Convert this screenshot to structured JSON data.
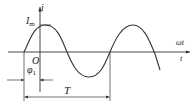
{
  "diagram": {
    "type": "sinusoidal-waveform",
    "labels": {
      "y_axis": "i",
      "amplitude": "I",
      "amplitude_sub": "m",
      "origin": "O",
      "phase": "φ",
      "phase_sub": "1",
      "period": "T",
      "x_axis_top": "ωt",
      "x_axis_bottom": "t"
    },
    "colors": {
      "line": "#333333",
      "background": "#ffffff"
    }
  }
}
